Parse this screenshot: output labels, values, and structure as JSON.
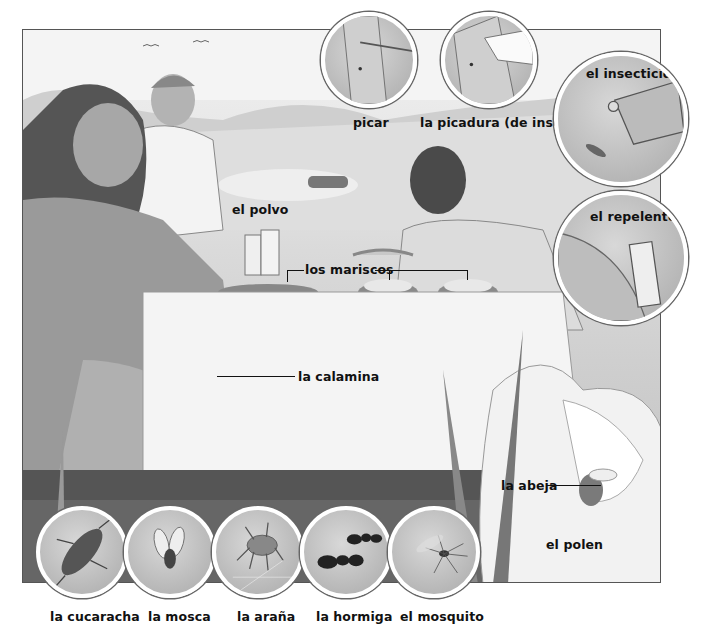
{
  "illustration": {
    "title": "Picnic scene vocabulary illustration",
    "colors": {
      "background": "#ffffff",
      "frame": "#555555",
      "circle_border": "#ffffff",
      "text": "#111111"
    }
  },
  "labels": {
    "picar": "picar",
    "picadura": "la picadura (de insecto)",
    "insecticida": "el insecticida",
    "repelente": "el repelente",
    "polvo": "el polvo",
    "mariscos": "los mariscos",
    "calamina": "la calamina",
    "abeja": "la abeja",
    "polen": "el polen"
  },
  "insects": [
    {
      "label": "la cucaracha",
      "icon": "cockroach-icon"
    },
    {
      "label": "la mosca",
      "icon": "fly-icon"
    },
    {
      "label": "la araña",
      "icon": "spider-icon"
    },
    {
      "label": "la hormiga",
      "icon": "ant-icon"
    },
    {
      "label": "el mosquito",
      "icon": "mosquito-icon"
    }
  ],
  "insets": [
    {
      "label": "picar",
      "depicts": "arm-bite"
    },
    {
      "label": "la picadura (de insecto)",
      "depicts": "arm-bite-mark"
    },
    {
      "label": "el insecticida",
      "depicts": "spray-can-and-insect"
    },
    {
      "label": "el repelente",
      "depicts": "arm-and-repellent-bottle"
    }
  ]
}
